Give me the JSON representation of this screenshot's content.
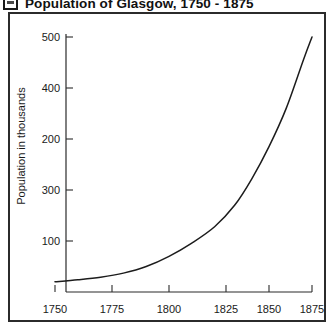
{
  "title": {
    "text": "Population of Glasgow, 1750 - 1875",
    "icon": "framed-image-icon"
  },
  "chart_data": {
    "type": "line",
    "title": "Population of Glasgow, 1750 - 1875",
    "xlabel": "",
    "ylabel": "Population in thousands",
    "xlim": [
      1750,
      1875
    ],
    "ylim": [
      0,
      500
    ],
    "grid": false,
    "legend": null,
    "x_ticks": [
      "1750",
      "1775",
      "1800",
      "1825",
      "1850",
      "1875"
    ],
    "y_ticks": [
      "100",
      "300",
      "200",
      "400",
      "500"
    ],
    "y_ticks_top_to_bottom": [
      "500",
      "400",
      "200",
      "300",
      "100"
    ],
    "x": [
      1750,
      1760,
      1770,
      1780,
      1790,
      1800,
      1810,
      1820,
      1830,
      1840,
      1850,
      1860,
      1870,
      1875
    ],
    "values": [
      20,
      24,
      29,
      37,
      50,
      70,
      96,
      128,
      170,
      222,
      285,
      360,
      455,
      500
    ],
    "series": [
      {
        "name": "Population of Glasgow",
        "values": [
          20,
          24,
          29,
          37,
          50,
          70,
          96,
          128,
          170,
          222,
          285,
          360,
          455,
          500
        ]
      }
    ],
    "curve_color": "#1c1c1c",
    "frame_color": "#2b2b2b"
  },
  "axes": {
    "y_axis_title": "Population in thousands",
    "y_tick_labels": [
      {
        "text": "500",
        "y": 31
      },
      {
        "text": "400",
        "y": 82
      },
      {
        "text": "200",
        "y": 133
      },
      {
        "text": "300",
        "y": 184
      },
      {
        "text": "100",
        "y": 235
      }
    ],
    "x_tick_labels": [
      {
        "text": "1750",
        "x": 55
      },
      {
        "text": "1775",
        "x": 112
      },
      {
        "text": "1800",
        "x": 169
      },
      {
        "text": "1825",
        "x": 226
      },
      {
        "text": "1850",
        "x": 269
      },
      {
        "text": "1875",
        "x": 312
      }
    ]
  }
}
